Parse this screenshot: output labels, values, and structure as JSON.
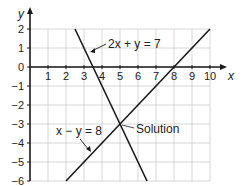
{
  "chart_data": {
    "type": "line",
    "title": "",
    "xlabel": "x",
    "ylabel": "y",
    "xlim": [
      0,
      10
    ],
    "ylim": [
      -6,
      2
    ],
    "x_ticks": [
      1,
      2,
      3,
      4,
      5,
      6,
      7,
      8,
      9,
      10
    ],
    "y_ticks": [
      2,
      1,
      0,
      -1,
      -2,
      -3,
      -4,
      -5,
      -6
    ],
    "grid": true,
    "series": [
      {
        "name": "2x + y = 7",
        "equation": "y = 7 - 2x",
        "points": [
          [
            2.5,
            2
          ],
          [
            6.5,
            -6
          ]
        ]
      },
      {
        "name": "x − y = 8",
        "equation": "y = x - 8",
        "points": [
          [
            2,
            -6
          ],
          [
            10,
            2
          ]
        ]
      }
    ],
    "annotations": [
      {
        "text": "2x + y = 7",
        "points_to": "line 2x + y = 7"
      },
      {
        "text": "x − y = 8",
        "points_to": "line x − y = 8"
      },
      {
        "text": "Solution",
        "points_to": [
          5,
          -3
        ]
      }
    ],
    "solution": [
      5,
      -3
    ]
  },
  "colors": {
    "line": "#1a1a1a",
    "grid": "#cccccc",
    "axis": "#1a1a1a",
    "text": "#222222"
  }
}
